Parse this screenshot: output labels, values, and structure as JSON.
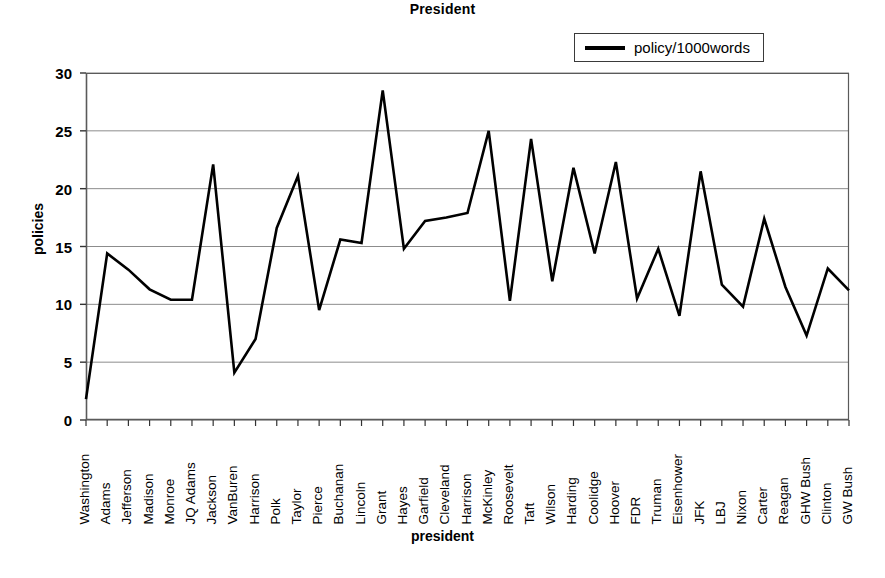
{
  "chart_data": {
    "type": "line",
    "title": "President",
    "xlabel": "president",
    "ylabel": "policies",
    "ylim": [
      0,
      30
    ],
    "yticks": [
      0,
      5,
      10,
      15,
      20,
      25,
      30
    ],
    "grid": true,
    "legend_position": "top-right",
    "legend": [
      "policy/1000words"
    ],
    "series_color": "#000000",
    "categories": [
      "Washington",
      "Adams",
      "Jefferson",
      "Madison",
      "Monroe",
      "JQ Adams",
      "Jackson",
      "VanBuren",
      "Harrison",
      "Polk",
      "Taylor",
      "Pierce",
      "Buchanan",
      "Lincoln",
      "Grant",
      "Hayes",
      "Garfield",
      "Cleveland",
      "Harrison",
      "McKinley",
      "Roosevelt",
      "Taft",
      "Wilson",
      "Harding",
      "Coolidge",
      "Hoover",
      "FDR",
      "Truman",
      "Eisenhower",
      "JFK",
      "LBJ",
      "Nixon",
      "Carter",
      "Reagan",
      "GHW Bush",
      "Clinton",
      "GW Bush"
    ],
    "series": [
      {
        "name": "policy/1000words",
        "values": [
          1.8,
          14.4,
          13.0,
          11.3,
          10.4,
          10.4,
          22.1,
          4.1,
          7.0,
          16.6,
          21.1,
          9.5,
          15.6,
          15.3,
          28.5,
          14.8,
          17.2,
          17.5,
          17.9,
          25.0,
          10.3,
          24.3,
          12.0,
          21.8,
          14.4,
          22.3,
          10.5,
          14.8,
          9.0,
          21.5,
          11.7,
          9.8,
          17.4,
          11.5,
          7.3,
          13.1,
          11.2
        ]
      }
    ]
  }
}
